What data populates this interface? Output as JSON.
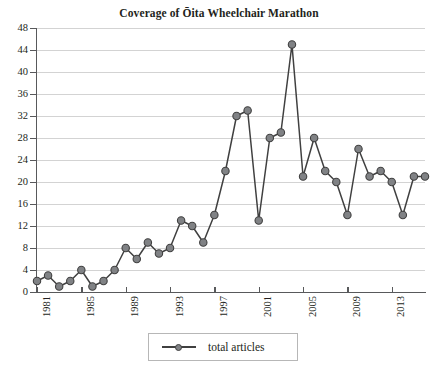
{
  "chart_data": {
    "type": "line",
    "title": "Coverage of Ōita Wheelchair Marathon",
    "xlabel": "",
    "ylabel": "",
    "grid": true,
    "legend_position": "bottom-center",
    "xlim": [
      1981,
      2016
    ],
    "ylim": [
      0,
      48
    ],
    "ytick_step": 4,
    "yticks": [
      0,
      4,
      8,
      12,
      16,
      20,
      24,
      28,
      32,
      36,
      40,
      44,
      48
    ],
    "ytick_labels": [
      "0",
      "4",
      "8",
      "12",
      "16",
      "20",
      "24",
      "28",
      "32",
      "36",
      "40",
      "44",
      "48"
    ],
    "xticks": [
      1981,
      1985,
      1989,
      1993,
      1997,
      2001,
      2005,
      2009,
      2013
    ],
    "xtick_labels": [
      "1981",
      "1985",
      "1989",
      "1993",
      "1997",
      "2001",
      "2005",
      "2009",
      "2013"
    ],
    "xtick_rotation": 90,
    "x": [
      1981,
      1982,
      1983,
      1984,
      1985,
      1986,
      1987,
      1988,
      1989,
      1990,
      1991,
      1992,
      1993,
      1994,
      1995,
      1996,
      1997,
      1998,
      1999,
      2000,
      2001,
      2002,
      2003,
      2004,
      2005,
      2006,
      2007,
      2008,
      2009,
      2010,
      2011,
      2012,
      2013,
      2014,
      2015,
      2016
    ],
    "series": [
      {
        "name": "total articles",
        "values": [
          2,
          3,
          1,
          2,
          4,
          1,
          2,
          4,
          8,
          6,
          9,
          7,
          8,
          13,
          12,
          9,
          14,
          22,
          32,
          33,
          13,
          28,
          29,
          45,
          21,
          28,
          22,
          20,
          14,
          26,
          21,
          22,
          20,
          14,
          21,
          21
        ],
        "line_color": "#404040",
        "marker_fill": "#808285",
        "marker_edge": "#404040"
      }
    ]
  },
  "legend": {
    "entries": [
      {
        "label": "total articles"
      }
    ]
  },
  "style": {
    "grid_color": "#d3d3d3",
    "axis_color": "#58595b",
    "text_color": "#231f20",
    "background": "#ffffff"
  }
}
